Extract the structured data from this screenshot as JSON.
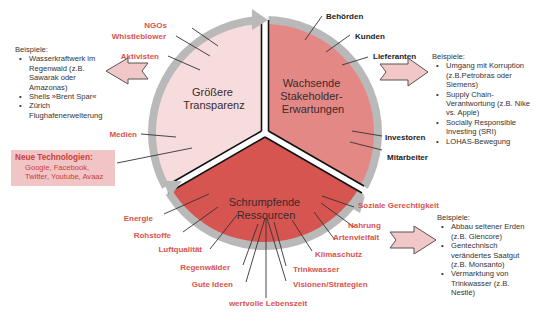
{
  "colors": {
    "segment_transparency": "#f6dcdc",
    "segment_stakeholder": "#e48886",
    "segment_resources": "#d65550",
    "ring": "#b8b8b8",
    "label_red": "#d9534f",
    "label_dark": "#222222",
    "arrow_fill": "#f2c7c7",
    "newtech_bg": "#f1c5c5"
  },
  "segments": {
    "transparency": {
      "title_line1": "Größere",
      "title_line2": "Transparenz"
    },
    "stakeholder": {
      "title_line1": "Wachsende",
      "title_line2": "Stakeholder-",
      "title_line3": "Erwartungen"
    },
    "resources": {
      "title_line1": "Schrumpfende",
      "title_line2": "Ressourcen"
    }
  },
  "labels": {
    "transparency": [
      "NGOs",
      "Whistleblower",
      "Aktivisten",
      "Medien"
    ],
    "stakeholder": [
      "Behörden",
      "Kunden",
      "Lieferanten",
      "Investoren",
      "Mitarbeiter"
    ],
    "resources": [
      "Energie",
      "Rohstoffe",
      "Luftqualität",
      "Regenwälder",
      "Gute Ideen",
      "wertvolle Lebenszeit",
      "Visionen/Strategien",
      "Trinkwasser",
      "Klimaschutz",
      "Artenvielfalt",
      "Nahrung",
      "Soziale Gerechtigkeit"
    ]
  },
  "new_technologies": {
    "heading": "Neue Technologien:",
    "line1": "Google, Facebook,",
    "line2": "Twitter, Youtube, Avaaz"
  },
  "examples_left": {
    "title": "Beispiele:",
    "items": [
      "Wasserkraftwerk im Regenwald (z.B. Sawarak oder Amazonas)",
      "Shells »Brent Spar«",
      "Zürich Flughafenerweiterung"
    ]
  },
  "examples_right_top": {
    "title": "Beispiele:",
    "items": [
      "Umgang mit Korruption (z.B.Petrobras oder Siemens)",
      "Supply Chain-Verantwortung (z.B. Nike vs. Apple)",
      "Socially Responsible Investing (SRI)",
      "LOHAS-Bewegung"
    ]
  },
  "examples_right_bottom": {
    "title": "Beispiele:",
    "items": [
      "Abbau seltener Erden (z.B. Glencore)",
      "Gentechnisch verändertes Saatgut (z.B. Monsanto)",
      "Vermarktung von Trinkwasser (z.B. Nestlé)"
    ]
  }
}
